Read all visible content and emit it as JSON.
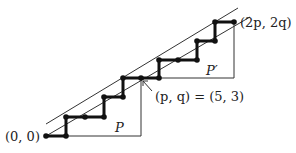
{
  "diagram": {
    "labels": {
      "origin": "(0, 0)",
      "pq_eq": "(p, q) = (5, 3)",
      "end": "(2p, 2q)",
      "P": "P",
      "Pprime": "P′"
    },
    "lattice_path_points": [
      [
        46,
        136
      ],
      [
        66,
        136
      ],
      [
        66,
        117
      ],
      [
        85,
        117
      ],
      [
        104,
        117
      ],
      [
        104,
        97
      ],
      [
        123,
        97
      ],
      [
        123,
        78
      ],
      [
        141,
        78
      ],
      [
        159,
        78
      ],
      [
        159,
        60
      ],
      [
        178,
        60
      ],
      [
        197,
        60
      ],
      [
        197,
        41
      ],
      [
        215,
        41
      ],
      [
        215,
        22
      ],
      [
        234,
        22
      ]
    ],
    "colors": {
      "path": "#111111",
      "line": "#333333"
    }
  }
}
